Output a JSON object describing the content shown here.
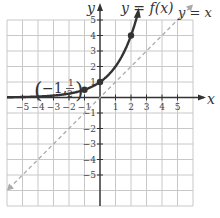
{
  "chart_data": {
    "type": "line",
    "title": "",
    "xlabel": "x",
    "ylabel": "y",
    "xlim": [
      -6,
      6
    ],
    "ylim": [
      -7,
      5.5
    ],
    "grid": true,
    "x_ticks": [
      "-5",
      "-4",
      "-3",
      "-2",
      "-1",
      "1",
      "2",
      "3",
      "4",
      "5"
    ],
    "y_ticks": [
      "5",
      "4",
      "3",
      "2",
      "1",
      "-1",
      "-2",
      "-3",
      "-4",
      "-5"
    ],
    "series": [
      {
        "name": "y = f(x)",
        "style": "solid",
        "color": "#333333",
        "function": "2^x",
        "x": [
          -5,
          -4,
          -3,
          -2,
          -1,
          0,
          1,
          2,
          2.5
        ],
        "y": [
          0.03125,
          0.0625,
          0.125,
          0.25,
          0.5,
          1,
          2,
          4,
          5.66
        ]
      },
      {
        "name": "y = x",
        "style": "dashed",
        "color": "#aaaaaa",
        "x": [
          -6,
          6
        ],
        "y": [
          -6,
          6
        ]
      }
    ],
    "points": [
      {
        "x": -1,
        "y": 0.5
      },
      {
        "x": 0,
        "y": 1
      },
      {
        "x": 2,
        "y": 4
      }
    ],
    "annotations": [
      {
        "text": "(-1, 1/2)",
        "x": -1,
        "y": 0.5
      },
      {
        "text": "y = f(x)",
        "position": "top-center"
      },
      {
        "text": "y = x",
        "position": "top-right"
      }
    ]
  },
  "labels": {
    "curve": "y = f(x)",
    "identity": "y = x",
    "point_open": "(",
    "point_x": "−1,",
    "point_num": "1",
    "point_den": "2",
    "point_close": ")",
    "x_axis": "x",
    "y_axis": "y"
  },
  "colors": {
    "grid": "#c8c8c8",
    "axis": "#333333",
    "curve": "#333333",
    "identity": "#aaaaaa"
  }
}
